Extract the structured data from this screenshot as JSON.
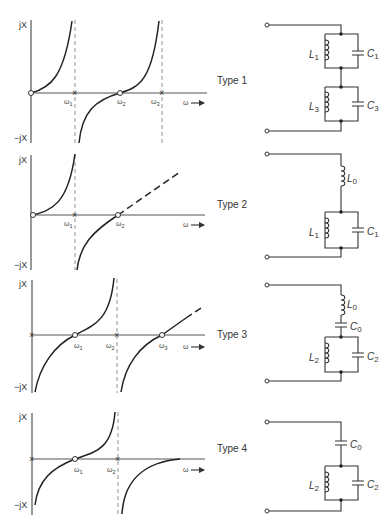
{
  "figure": {
    "axis_labels": {
      "y_pos": "jX",
      "y_neg": "−jX",
      "x": "ω"
    },
    "panels": [
      {
        "type_label": "Type 1",
        "markers": [
          {
            "label": "ω1",
            "kind": "pole"
          },
          {
            "label": "ω2",
            "kind": "zero"
          },
          {
            "label": "ω3",
            "kind": "pole"
          }
        ],
        "origin": "zero",
        "behavior": "zero at origin, pole ω1, zero ω2, pole ω3",
        "circuit": {
          "components": [
            {
              "type": "inductor",
              "label": "L1",
              "group": "tank1"
            },
            {
              "type": "capacitor",
              "label": "C1",
              "group": "tank1"
            },
            {
              "type": "inductor",
              "label": "L3",
              "group": "tank2"
            },
            {
              "type": "capacitor",
              "label": "C3",
              "group": "tank2"
            }
          ]
        }
      },
      {
        "type_label": "Type 2",
        "markers": [
          {
            "label": "ω1",
            "kind": "pole"
          },
          {
            "label": "ω2",
            "kind": "zero"
          }
        ],
        "origin": "zero",
        "behavior": "zero at origin, pole ω1, zero ω2, asymptotically linear (dashed)",
        "circuit": {
          "components": [
            {
              "type": "inductor",
              "label": "L0",
              "group": "series"
            },
            {
              "type": "inductor",
              "label": "L1",
              "group": "tank"
            },
            {
              "type": "capacitor",
              "label": "C1",
              "group": "tank"
            }
          ]
        }
      },
      {
        "type_label": "Type 3",
        "markers": [
          {
            "label": "ω1",
            "kind": "zero"
          },
          {
            "label": "ω2",
            "kind": "pole"
          },
          {
            "label": "ω3",
            "kind": "zero"
          }
        ],
        "origin": "pole",
        "behavior": "pole at origin, zero ω1, pole ω2, zero ω3, asymptotically linear (dashed)",
        "circuit": {
          "components": [
            {
              "type": "inductor",
              "label": "L0",
              "group": "series"
            },
            {
              "type": "capacitor",
              "label": "C0",
              "group": "series"
            },
            {
              "type": "inductor",
              "label": "L2",
              "group": "tank"
            },
            {
              "type": "capacitor",
              "label": "C2",
              "group": "tank"
            }
          ]
        }
      },
      {
        "type_label": "Type 4",
        "markers": [
          {
            "label": "ω1",
            "kind": "zero"
          },
          {
            "label": "ω2",
            "kind": "pole"
          }
        ],
        "origin": "pole",
        "behavior": "pole at origin, zero ω1, pole ω2, approaches zero from below",
        "circuit": {
          "components": [
            {
              "type": "capacitor",
              "label": "C0",
              "group": "series"
            },
            {
              "type": "inductor",
              "label": "L2",
              "group": "tank"
            },
            {
              "type": "capacitor",
              "label": "C2",
              "group": "tank"
            }
          ]
        }
      }
    ]
  }
}
